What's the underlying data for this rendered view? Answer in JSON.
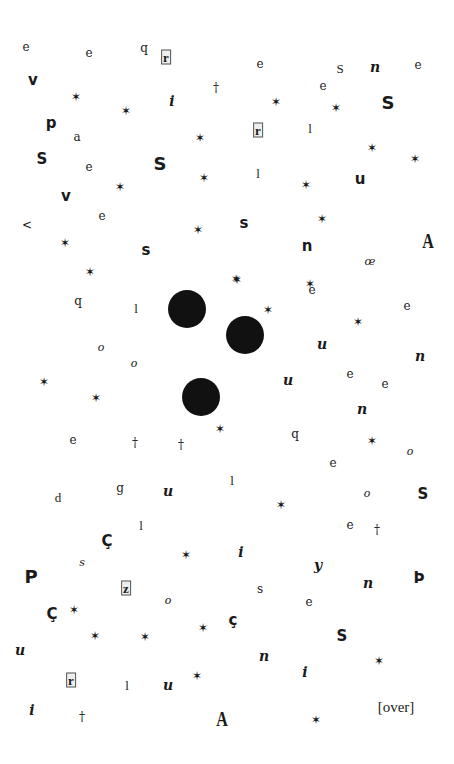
{
  "glyphs": [
    {
      "t": "e",
      "c": "serif"
    },
    {
      "t": "e",
      "c": "serif"
    },
    {
      "t": "q",
      "c": "serif"
    },
    {
      "t": "r",
      "c": "box"
    },
    {
      "t": "e",
      "c": "serif"
    },
    {
      "t": "S",
      "c": "lserif"
    },
    {
      "t": "n",
      "c": "ital"
    },
    {
      "t": "e",
      "c": "serif"
    },
    {
      "t": "v",
      "c": "bold"
    },
    {
      "t": "✶",
      "c": "star"
    },
    {
      "t": "✶",
      "c": "star"
    },
    {
      "t": "i",
      "c": "ital"
    },
    {
      "t": "†",
      "c": "serif"
    },
    {
      "t": "e",
      "c": "serif"
    },
    {
      "t": "✶",
      "c": "star"
    },
    {
      "t": "✶",
      "c": "star"
    },
    {
      "t": "S",
      "c": "bigbold"
    },
    {
      "t": "p",
      "c": "bold"
    },
    {
      "t": "a",
      "c": "serif"
    },
    {
      "t": "✶",
      "c": "star"
    },
    {
      "t": "r",
      "c": "box"
    },
    {
      "t": "l",
      "c": "lserif"
    },
    {
      "t": "✶",
      "c": "star"
    },
    {
      "t": "✶",
      "c": "star"
    },
    {
      "t": "S",
      "c": "bold"
    },
    {
      "t": "e",
      "c": "serif"
    },
    {
      "t": "S",
      "c": "bigbold"
    },
    {
      "t": "✶",
      "c": "star"
    },
    {
      "t": "l",
      "c": "lserif"
    },
    {
      "t": "✶",
      "c": "star"
    },
    {
      "t": "u",
      "c": "bold"
    },
    {
      "t": "v",
      "c": "bold"
    },
    {
      "t": "✶",
      "c": "star"
    },
    {
      "t": "✶",
      "c": "star"
    },
    {
      "t": "e",
      "c": "serif"
    },
    {
      "t": "<",
      "c": "serif"
    },
    {
      "t": "s",
      "c": "bold"
    },
    {
      "t": "✶",
      "c": "star"
    },
    {
      "t": "✶",
      "c": "star"
    },
    {
      "t": "✶",
      "c": "star"
    },
    {
      "t": "s",
      "c": "bold"
    },
    {
      "t": "n",
      "c": "bold"
    },
    {
      "t": "A",
      "c": "A"
    },
    {
      "t": "œ",
      "c": "oval"
    },
    {
      "t": "✶",
      "c": "star"
    },
    {
      "t": "✶",
      "c": "star"
    },
    {
      "t": "q",
      "c": "serif"
    },
    {
      "t": "l",
      "c": "lserif"
    },
    {
      "t": "e",
      "c": "serif"
    },
    {
      "t": "✶",
      "c": "star"
    },
    {
      "t": "e",
      "c": "serif"
    },
    {
      "t": "✶",
      "c": "star"
    },
    {
      "t": "✶",
      "c": "star"
    },
    {
      "t": "o",
      "c": "oval"
    },
    {
      "t": "o",
      "c": "oval"
    },
    {
      "t": "u",
      "c": "ital"
    },
    {
      "t": "n",
      "c": "ital"
    },
    {
      "t": "✶",
      "c": "star"
    },
    {
      "t": "✶",
      "c": "star"
    },
    {
      "t": "u",
      "c": "ital"
    },
    {
      "t": "e",
      "c": "serif"
    },
    {
      "t": "e",
      "c": "serif"
    },
    {
      "t": "n",
      "c": "ital"
    },
    {
      "t": "e",
      "c": "serif"
    },
    {
      "t": "†",
      "c": "serif"
    },
    {
      "t": "†",
      "c": "serif"
    },
    {
      "t": "✶",
      "c": "star"
    },
    {
      "t": "q",
      "c": "serif"
    },
    {
      "t": "✶",
      "c": "star"
    },
    {
      "t": "o",
      "c": "oval"
    },
    {
      "t": "e",
      "c": "serif"
    },
    {
      "t": "d",
      "c": "lserif"
    },
    {
      "t": "g",
      "c": "serif"
    },
    {
      "t": "u",
      "c": "ital"
    },
    {
      "t": "l",
      "c": "lserif"
    },
    {
      "t": "o",
      "c": "oval"
    },
    {
      "t": "S",
      "c": "bold"
    },
    {
      "t": "✶",
      "c": "star"
    },
    {
      "t": "l",
      "c": "lserif"
    },
    {
      "t": "e",
      "c": "serif"
    },
    {
      "t": "†",
      "c": "serif"
    },
    {
      "t": "Ç",
      "c": "bold"
    },
    {
      "t": "s",
      "c": "oval"
    },
    {
      "t": "✶",
      "c": "star"
    },
    {
      "t": "i",
      "c": "ital"
    },
    {
      "t": "P",
      "c": "bigbold"
    },
    {
      "t": "y",
      "c": "ital"
    },
    {
      "t": "n",
      "c": "ital"
    },
    {
      "t": "Þ",
      "c": "bold"
    },
    {
      "t": "z",
      "c": "box"
    },
    {
      "t": "s",
      "c": "serif"
    },
    {
      "t": "o",
      "c": "oval"
    },
    {
      "t": "e",
      "c": "serif"
    },
    {
      "t": "Ç",
      "c": "bold"
    },
    {
      "t": "✶",
      "c": "star"
    },
    {
      "t": "✶",
      "c": "star"
    },
    {
      "t": "✶",
      "c": "star"
    },
    {
      "t": "✶",
      "c": "star"
    },
    {
      "t": "ç",
      "c": "bold"
    },
    {
      "t": "S",
      "c": "bold"
    },
    {
      "t": "u",
      "c": "ital"
    },
    {
      "t": "n",
      "c": "ital"
    },
    {
      "t": "✶",
      "c": "star"
    },
    {
      "t": "i",
      "c": "ital"
    },
    {
      "t": "r",
      "c": "box"
    },
    {
      "t": "l",
      "c": "lserif"
    },
    {
      "t": "u",
      "c": "ital"
    },
    {
      "t": "✶",
      "c": "star"
    },
    {
      "t": "i",
      "c": "ital"
    },
    {
      "t": "†",
      "c": "serif"
    },
    {
      "t": "A",
      "c": "A"
    },
    {
      "t": "✶",
      "c": "star"
    }
  ],
  "footer": {
    "over_label": "[over]"
  }
}
